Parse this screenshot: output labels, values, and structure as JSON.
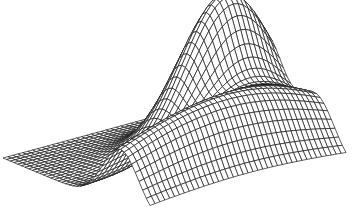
{
  "chart_data": {
    "type": "surface-wireframe",
    "title": "",
    "xlabel": "",
    "ylabel": "",
    "zlabel": "",
    "axes_visible": false,
    "grid": {
      "nx": 40,
      "ny": 40
    },
    "x_range": [
      0,
      1
    ],
    "y_range": [
      0,
      1
    ],
    "z_range": [
      0,
      1
    ],
    "surface": "sum of two Gaussian bumps over flat base",
    "peaks": [
      {
        "name": "small-peak",
        "x": 0.2,
        "y": 0.5,
        "height": 0.55,
        "sx": 0.12,
        "sy": 0.6
      },
      {
        "name": "tall-peak",
        "x": 0.55,
        "y": 0.8,
        "height": 1.0,
        "sx": 0.13,
        "sy": 0.22
      }
    ],
    "projection": {
      "origin": [
        150,
        220
      ],
      "x_axis_vec": [
        -147,
        -62
      ],
      "y_axis_vec": [
        196,
        -53
      ],
      "z_scale": 150
    },
    "line_color": "#1a1a1a",
    "background": "#ffffff"
  }
}
